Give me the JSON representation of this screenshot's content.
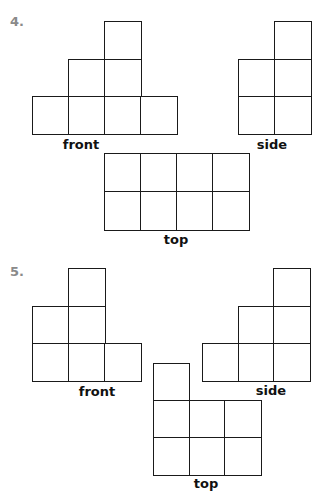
{
  "problems": [
    {
      "number": "4.",
      "number_pos": [
        10,
        14
      ],
      "views": [
        {
          "name": "front",
          "label": "front",
          "label_pos": [
            81,
            137
          ],
          "origin": [
            32,
            21
          ],
          "cell": [
            36,
            37.5
          ],
          "cells": [
            [
              2,
              0
            ],
            [
              1,
              1
            ],
            [
              2,
              1
            ],
            [
              0,
              2
            ],
            [
              1,
              2
            ],
            [
              2,
              2
            ],
            [
              3,
              2
            ]
          ]
        },
        {
          "name": "side",
          "label": "side",
          "label_pos": [
            272,
            137
          ],
          "origin": [
            238,
            21
          ],
          "cell": [
            36,
            37.5
          ],
          "cells": [
            [
              1,
              0
            ],
            [
              0,
              1
            ],
            [
              1,
              1
            ],
            [
              0,
              2
            ],
            [
              1,
              2
            ]
          ]
        },
        {
          "name": "top",
          "label": "top",
          "label_pos": [
            176,
            232
          ],
          "origin": [
            104,
            153
          ],
          "cell": [
            36,
            38
          ],
          "cells": [
            [
              0,
              0
            ],
            [
              1,
              0
            ],
            [
              2,
              0
            ],
            [
              3,
              0
            ],
            [
              0,
              1
            ],
            [
              1,
              1
            ],
            [
              2,
              1
            ],
            [
              3,
              1
            ]
          ]
        }
      ]
    },
    {
      "number": "5.",
      "number_pos": [
        10,
        264
      ],
      "views": [
        {
          "name": "front",
          "label": "front",
          "label_pos": [
            97,
            384
          ],
          "origin": [
            32,
            268
          ],
          "cell": [
            36,
            37.5
          ],
          "cells": [
            [
              1,
              0
            ],
            [
              0,
              1
            ],
            [
              1,
              1
            ],
            [
              0,
              2
            ],
            [
              1,
              2
            ],
            [
              2,
              2
            ]
          ]
        },
        {
          "name": "side",
          "label": "side",
          "label_pos": [
            271,
            383
          ],
          "origin": [
            202,
            268
          ],
          "cell": [
            35.7,
            37.5
          ],
          "cells": [
            [
              2,
              0
            ],
            [
              1,
              1
            ],
            [
              2,
              1
            ],
            [
              0,
              2
            ],
            [
              1,
              2
            ],
            [
              2,
              2
            ]
          ]
        },
        {
          "name": "top",
          "label": "top",
          "label_pos": [
            206,
            476
          ],
          "origin": [
            153,
            363
          ],
          "cell": [
            35.7,
            37
          ],
          "cells": [
            [
              0,
              0
            ],
            [
              0,
              1
            ],
            [
              1,
              1
            ],
            [
              2,
              1
            ],
            [
              0,
              2
            ],
            [
              1,
              2
            ],
            [
              2,
              2
            ]
          ]
        }
      ]
    }
  ]
}
